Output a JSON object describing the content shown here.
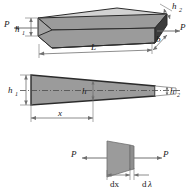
{
  "figure": {
    "background_color": "#ffffff",
    "line_color": "#2b2b2b",
    "dim_line_color": "#707070",
    "fill_top": "#d4d4d4",
    "fill_front": "#9a9a9a",
    "fill_end": "#3c3c3c",
    "fill_side": "#9a9a9a",
    "fill_element": "#9a9a9a"
  },
  "panels": [
    {
      "id": "isometric-view",
      "name": "3d-beam-view",
      "labels": {
        "load_left": "P",
        "load_right": "P",
        "height_left": "h",
        "height_left_sub": "1",
        "height_right": "h",
        "height_right_sub": "2",
        "length": "L",
        "width": "b"
      }
    },
    {
      "id": "elevation-view",
      "name": "side-elevation-view",
      "labels": {
        "height_left": "h",
        "height_left_sub": "1",
        "height_mid": "h",
        "height_right": "h",
        "height_right_sub": "2",
        "distance": "x"
      }
    },
    {
      "id": "element-view",
      "name": "differential-element-view",
      "labels": {
        "load_left": "P",
        "load_right": "P",
        "dx": "dx",
        "dlambda_d": "d",
        "dlambda_l": "λ"
      }
    }
  ]
}
